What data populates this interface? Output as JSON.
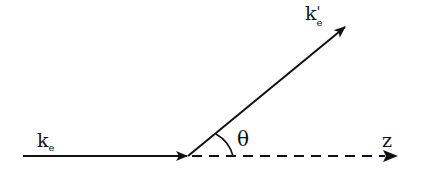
{
  "diagram": {
    "type": "scattering-geometry",
    "labels": {
      "incident": {
        "main": "k",
        "sub": "e",
        "prime": ""
      },
      "scattered": {
        "main": "k",
        "sub": "e",
        "prime": "'"
      },
      "angle": "θ",
      "axis": "z"
    },
    "colors": {
      "stroke": "#111111",
      "background": "#ffffff"
    }
  }
}
